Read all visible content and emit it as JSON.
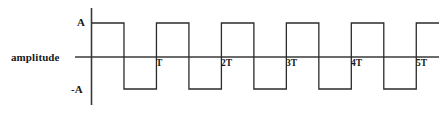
{
  "figure": {
    "axis_label": "amplitude",
    "y_labels": {
      "positive": "A",
      "negative": "-A"
    },
    "x_tick_labels": [
      "T",
      "2T",
      "3T",
      "4T",
      "5T"
    ],
    "colors": {
      "line": "#2b2b2b",
      "axis": "#3a3a3a",
      "text": "#1a1a1a",
      "background": "#ffffff"
    }
  },
  "chart_data": {
    "type": "line",
    "title": "",
    "subtitle": "",
    "xlabel": "",
    "ylabel": "amplitude",
    "waveform": "square",
    "amplitude_levels": {
      "high": "A",
      "zero": "0",
      "low": "-A"
    },
    "period": 1,
    "duty_cycle": 0.5,
    "x": [
      0,
      0.5,
      0.5,
      1,
      1,
      1.5,
      1.5,
      2,
      2,
      2.5,
      2.5,
      3,
      3,
      3.5,
      3.5,
      4,
      4,
      4.5,
      4.5,
      5,
      5,
      5.35
    ],
    "values": [
      1,
      1,
      -1,
      -1,
      1,
      1,
      -1,
      -1,
      1,
      1,
      -1,
      -1,
      1,
      1,
      -1,
      -1,
      1,
      1,
      -1,
      -1,
      1,
      1
    ],
    "xlim": [
      0,
      5.35
    ],
    "ylim": [
      -1,
      1
    ],
    "x_ticks": [
      1,
      2,
      3,
      4,
      5
    ],
    "x_tick_labels": [
      "T",
      "2T",
      "3T",
      "4T",
      "5T"
    ],
    "y_ticks": [
      1,
      0,
      -1
    ],
    "y_tick_labels": [
      "A",
      "0",
      "-A"
    ],
    "grid": false,
    "legend": false,
    "legend_position": "none"
  }
}
